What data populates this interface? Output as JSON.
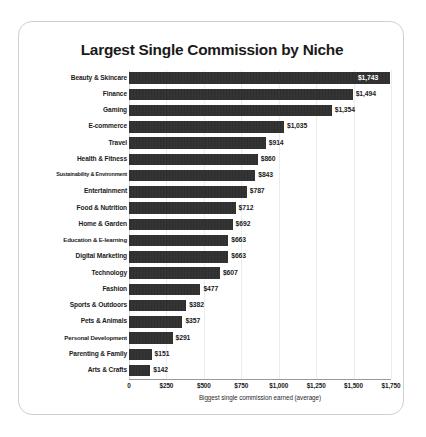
{
  "card": {
    "title": "Largest Single Commission by Niche"
  },
  "chart_data": {
    "type": "bar",
    "orientation": "horizontal",
    "title": "Largest Single Commission by Niche",
    "xlabel": "Biggest single commission earned (average)",
    "ylabel": "",
    "xlim": [
      0,
      1750
    ],
    "grid": true,
    "legend": null,
    "bar_color": "#2c2c2c",
    "tick_labels": [
      "0",
      "$250",
      "$500",
      "$750",
      "$1,000",
      "$1,250",
      "$1,500",
      "$1,750"
    ],
    "tick_values": [
      0,
      250,
      500,
      750,
      1000,
      1250,
      1500,
      1750
    ],
    "categories": [
      "Beauty & Skincare",
      "Finance",
      "Gaming",
      "E-commerce",
      "Travel",
      "Health & Fitness",
      "Sustainability & Environment",
      "Entertainment",
      "Food & Nutrition",
      "Home & Garden",
      "Education & E-learning",
      "Digital Marketing",
      "Technology",
      "Fashion",
      "Sports & Outdoors",
      "Pets & Animals",
      "Personal Development",
      "Parenting & Family",
      "Arts & Crafts"
    ],
    "values": [
      1743,
      1494,
      1354,
      1035,
      914,
      860,
      843,
      787,
      712,
      692,
      663,
      663,
      607,
      477,
      382,
      357,
      291,
      151,
      142
    ],
    "value_labels": [
      "$1,743",
      "$1,494",
      "$1,354",
      "$1,035",
      "$914",
      "$860",
      "$843",
      "$787",
      "$712",
      "$692",
      "$663",
      "$663",
      "$607",
      "$477",
      "$382",
      "$357",
      "$291",
      "$151",
      "$142"
    ]
  }
}
